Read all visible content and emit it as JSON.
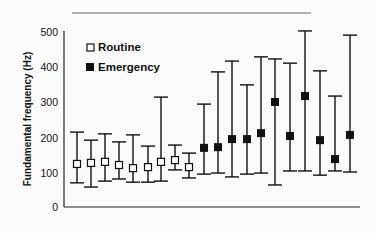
{
  "chart_data": {
    "type": "scatter",
    "subtype": "error-bar",
    "title": "",
    "xlabel": "",
    "ylabel": "Fundamental frequency (Hz)",
    "ylim": [
      0,
      500
    ],
    "yticks": [
      0,
      100,
      200,
      300,
      400,
      500
    ],
    "grid": false,
    "legend_position": "upper-left",
    "series": [
      {
        "name": "Routine",
        "marker": "open-square",
        "mean": [
          123,
          126,
          129,
          120,
          111,
          114,
          129,
          134,
          114
        ],
        "upper": [
          214,
          191,
          209,
          186,
          206,
          174,
          314,
          177,
          154
        ],
        "lower": [
          69,
          57,
          74,
          80,
          71,
          71,
          74,
          106,
          83
        ]
      },
      {
        "name": "Emergency",
        "marker": "filled-square",
        "mean": [
          169,
          171,
          194,
          194,
          211,
          300,
          203,
          317,
          191,
          137,
          206
        ],
        "upper": [
          294,
          386,
          417,
          349,
          429,
          423,
          411,
          503,
          389,
          317,
          491
        ],
        "lower": [
          94,
          97,
          86,
          94,
          97,
          63,
          103,
          103,
          91,
          103,
          100
        ]
      }
    ]
  },
  "legend": {
    "routine": "Routine",
    "emergency": "Emergency"
  },
  "axis": {
    "ylabel": "Fundamental frequency (Hz)",
    "ticks": [
      "0",
      "100",
      "200",
      "300",
      "400",
      "500"
    ]
  }
}
